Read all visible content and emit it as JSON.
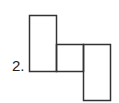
{
  "figure": {
    "label": "2.",
    "stroke_color": "#333333",
    "shapes": [
      {
        "name": "tall-left-rect",
        "x": 29,
        "y": 15,
        "w": 27,
        "h": 56
      },
      {
        "name": "middle-square",
        "x": 56,
        "y": 44,
        "w": 27,
        "h": 27
      },
      {
        "name": "tall-right-rect",
        "x": 83,
        "y": 44,
        "w": 27,
        "h": 56
      }
    ]
  }
}
